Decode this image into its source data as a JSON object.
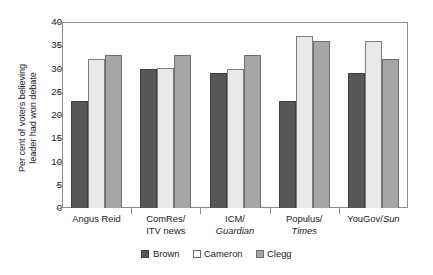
{
  "chart_data": {
    "type": "bar",
    "title": "",
    "xlabel": "",
    "ylabel": "Per cent of voters believing\nleader had won debate",
    "ylim": [
      0,
      40
    ],
    "yticks": [
      0,
      5,
      10,
      15,
      20,
      25,
      30,
      35,
      40
    ],
    "ytick_labels": [
      "0",
      "5",
      "10",
      "15",
      "20",
      "25",
      "30",
      "35",
      "40"
    ],
    "grid": false,
    "legend_position": "bottom-center",
    "categories": [
      "Angus Reid",
      "ComRes/\nITV news",
      "ICM/\nGuardian",
      "Populus/\nTimes",
      "YouGov/Sun"
    ],
    "category_parts": [
      {
        "line1": "Angus Reid",
        "line2": "",
        "line1_italic": false,
        "line2_italic": false
      },
      {
        "line1": "ComRes/",
        "line2": "ITV news",
        "line1_italic": false,
        "line2_italic": false
      },
      {
        "line1": "ICM/",
        "line2": "Guardian",
        "line1_italic": false,
        "line2_italic": true
      },
      {
        "line1": "Populus/",
        "line2": "Times",
        "line1_italic": false,
        "line2_italic": true
      },
      {
        "line1": "YouGov/",
        "line2": "Sun",
        "line1_italic": false,
        "line2_italic": true,
        "inline": true
      }
    ],
    "series": [
      {
        "name": "Brown",
        "color": "#575757",
        "values": [
          23,
          30,
          29,
          23,
          29
        ]
      },
      {
        "name": "Cameron",
        "color": "#e9e9e9",
        "values": [
          32,
          30.2,
          30,
          37,
          36
        ]
      },
      {
        "name": "Clegg",
        "color": "#a6a6a6",
        "values": [
          33,
          33,
          33,
          36,
          32
        ]
      }
    ],
    "legend": [
      "Brown",
      "Cameron",
      "Clegg"
    ]
  }
}
